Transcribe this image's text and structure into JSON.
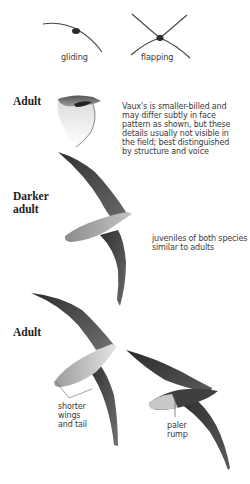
{
  "flight_silhouettes": {
    "gliding": {
      "label": "gliding",
      "icon": "gliding-silhouette-icon"
    },
    "flapping": {
      "label": "flapping",
      "icon": "flapping-silhouette-icon"
    }
  },
  "sections": [
    {
      "label": "Adult",
      "figure": "head-profile-illustration",
      "note_lines": [
        "Vaux's is smaller-billed and",
        "may differ subtly in face",
        "pattern as shown, but these",
        "details usually not visible in",
        "the field; best distinguished",
        "by structure and voice"
      ]
    },
    {
      "label_lines": [
        "Darker",
        "adult"
      ],
      "figure": "darker-adult-flight-illustration",
      "note_lines": [
        "juveniles of both species",
        "similar to adults"
      ]
    },
    {
      "label": "Adult",
      "figures": [
        "adult-underside-flight-illustration",
        "adult-upperside-flight-illustration"
      ],
      "annotations": [
        {
          "lines": [
            "shorter",
            "wings",
            "and tail"
          ]
        },
        {
          "lines": [
            "paler",
            "rump"
          ]
        }
      ]
    }
  ],
  "colors": {
    "ink": "#2b2b2b",
    "wing_dark": "#3c3c3c",
    "body_light": "#bdbdbd",
    "text": "#3a3a3a"
  }
}
